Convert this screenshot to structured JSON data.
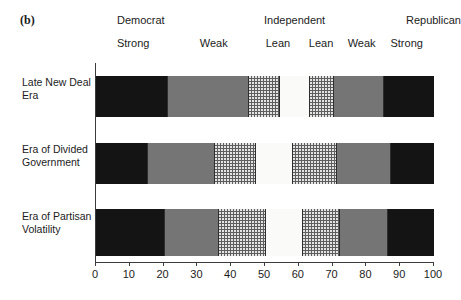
{
  "figure": {
    "panel_letter": "(b)"
  },
  "group_headers": [
    {
      "label": "Democrat",
      "x_pct": 6.5
    },
    {
      "label": "Independent",
      "x_pct": 50.0
    },
    {
      "label": "Republican",
      "x_pct": 92.0
    }
  ],
  "sub_headers": [
    {
      "label": "Strong",
      "x_pct": 6.5
    },
    {
      "label": "Weak",
      "x_pct": 31.0
    },
    {
      "label": "Lean",
      "x_pct": 50.5
    },
    {
      "label": "Lean",
      "x_pct": 70.5
    },
    {
      "label": "Weak",
      "x_pct": 83.0
    },
    {
      "label": "Strong",
      "x_pct": 97.0
    }
  ],
  "axis": {
    "xlabel": "",
    "ticks": [
      0,
      10,
      20,
      30,
      40,
      50,
      60,
      70,
      80,
      90,
      100
    ],
    "xlim": [
      0,
      100
    ]
  },
  "colors": {
    "strong_democrat": "#141414",
    "weak_democrat": "#757575",
    "lean_democrat": "#5e5e5e",
    "independent": "#fafaf8",
    "lean_republican": "#5e5e5e",
    "weak_republican": "#757575",
    "strong_republican": "#141414",
    "axis": "#3b3b3b",
    "text": "#1c1c1c"
  },
  "chart_data": {
    "type": "bar",
    "orientation": "horizontal",
    "stacked": true,
    "title": "",
    "xlabel": "",
    "ylabel": "",
    "xlim": [
      0,
      100
    ],
    "grid": false,
    "legend": "none",
    "categories": [
      "Late New Deal Era",
      "Era of Divided Government",
      "Era of Partisan Volatility"
    ],
    "series": [
      {
        "name": "Strong Democrat",
        "fill": "black",
        "values": [
          21,
          15,
          20
        ]
      },
      {
        "name": "Weak Democrat",
        "fill": "gray",
        "values": [
          24,
          20,
          16
        ]
      },
      {
        "name": "Lean Democrat",
        "fill": "dot",
        "values": [
          9,
          12,
          14
        ]
      },
      {
        "name": "Independent",
        "fill": "white",
        "values": [
          9,
          11,
          11
        ]
      },
      {
        "name": "Lean Republican",
        "fill": "dot",
        "values": [
          7,
          13,
          11
        ]
      },
      {
        "name": "Weak Republican",
        "fill": "gray",
        "values": [
          15,
          16,
          14
        ]
      },
      {
        "name": "Strong Republican",
        "fill": "black",
        "values": [
          15,
          13,
          14
        ]
      }
    ],
    "cumulative_boundaries": [
      [
        21,
        45,
        54,
        63,
        70,
        85,
        100
      ],
      [
        15,
        35,
        47,
        58,
        71,
        87,
        100
      ],
      [
        20,
        36,
        50,
        61,
        72,
        86,
        100
      ]
    ]
  },
  "rows": [
    {
      "label": "Late New Deal Era",
      "top_px": 76,
      "row_index": 0
    },
    {
      "label": "Era of Divided Government",
      "top_px": 143,
      "row_index": 1
    },
    {
      "label": "Era of Partisan Volatility",
      "top_px": 210,
      "row_index": 2
    }
  ]
}
